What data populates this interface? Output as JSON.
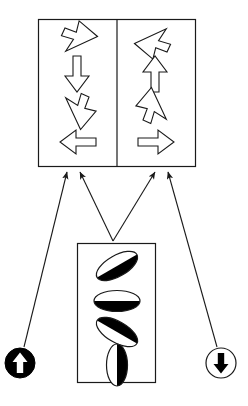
{
  "figure": {
    "type": "diagram",
    "background_color": "#ffffff",
    "stroke_color": "#1a1a1a",
    "fill_color": "#000000"
  },
  "top_panel": {
    "name": "arrow-panel",
    "x": 38,
    "y": 19,
    "width": 158,
    "height": 148,
    "divider_x": 117,
    "left_cell": {
      "name": "arrow-cell-left",
      "items": [
        {
          "label": "arrow-southeast",
          "direction": "southeast",
          "angle_deg": 135,
          "style": "outline"
        },
        {
          "label": "arrow-south",
          "direction": "south",
          "angle_deg": 90,
          "style": "outline"
        },
        {
          "label": "arrow-southwest",
          "direction": "southwest",
          "angle_deg": 225,
          "style": "outline"
        },
        {
          "label": "arrow-west",
          "direction": "west",
          "angle_deg": 180,
          "style": "outline"
        }
      ]
    },
    "right_cell": {
      "name": "arrow-cell-right",
      "items": [
        {
          "label": "arrow-northwest",
          "direction": "northwest",
          "angle_deg": 315,
          "style": "outline"
        },
        {
          "label": "arrow-north",
          "direction": "north",
          "angle_deg": 270,
          "style": "outline"
        },
        {
          "label": "arrow-northeast",
          "direction": "northeast",
          "angle_deg": 45,
          "style": "outline"
        },
        {
          "label": "arrow-east",
          "direction": "east",
          "angle_deg": 0,
          "style": "outline"
        }
      ]
    }
  },
  "bottom_panel": {
    "name": "ellipse-panel",
    "x": 77,
    "y": 243,
    "width": 79,
    "height": 140,
    "items": [
      {
        "label": "ellipse-tilt-up-right",
        "tilt_deg": -30,
        "dark_side": "bottom-right",
        "light_side": "top-left"
      },
      {
        "label": "ellipse-horizontal",
        "tilt_deg": 0,
        "dark_side": "bottom",
        "light_side": "top"
      },
      {
        "label": "ellipse-tilt-down-right",
        "tilt_deg": 30,
        "dark_side": "top-left",
        "light_side": "bottom-right"
      },
      {
        "label": "ellipse-vertical",
        "tilt_deg": 90,
        "dark_side": "left",
        "light_side": "right"
      }
    ]
  },
  "badges": [
    {
      "label": "badge-up-filled",
      "name": "badge-up",
      "cx": 20,
      "cy": 363,
      "r": 15,
      "circle_fill": "#000000",
      "arrow_fill": "#ffffff",
      "arrow_direction": "up"
    },
    {
      "label": "badge-down-outline",
      "name": "badge-down",
      "cx": 221,
      "cy": 363,
      "r": 15,
      "circle_fill": "#ffffff",
      "arrow_fill": "#000000",
      "arrow_direction": "down"
    }
  ],
  "connectors": [
    {
      "label": "connector-badge-up-to-left-cell",
      "from": "badge-up",
      "to": "arrow-cell-left",
      "x1": 24,
      "y1": 347,
      "x2": 67,
      "y2": 172
    },
    {
      "label": "connector-ellipses-to-left-cell",
      "from": "ellipse-panel",
      "to": "arrow-cell-left",
      "x1": 113,
      "y1": 241,
      "x2": 80,
      "y2": 172
    },
    {
      "label": "connector-ellipses-to-right-cell",
      "from": "ellipse-panel",
      "to": "arrow-cell-right",
      "x1": 113,
      "y1": 241,
      "x2": 155,
      "y2": 172
    },
    {
      "label": "connector-badge-down-to-right-cell",
      "from": "badge-down",
      "to": "arrow-cell-right",
      "x1": 217,
      "y1": 347,
      "x2": 168,
      "y2": 172
    }
  ]
}
